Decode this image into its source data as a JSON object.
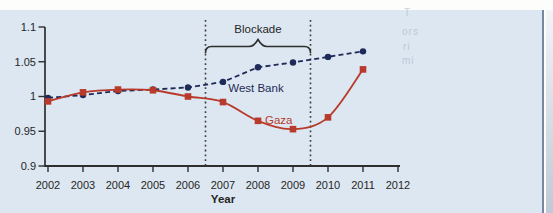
{
  "figure": {
    "panel_background": "#dde7f1",
    "edge_line_color": "#76879f",
    "axis_color": "#2e2e2e",
    "text_color": "#262626"
  },
  "chart_data": {
    "type": "line",
    "title": "",
    "xlabel": "Year",
    "ylabel": "",
    "xlim": [
      2002,
      2012
    ],
    "ylim": [
      0.9,
      1.1
    ],
    "grid": false,
    "legend": "inline-labels",
    "x_ticks": [
      "2002",
      "2003",
      "2004",
      "2005",
      "2006",
      "2007",
      "2008",
      "2009",
      "2010",
      "2011",
      "2012"
    ],
    "x_tick_values": [
      2002,
      2003,
      2004,
      2005,
      2006,
      2007,
      2008,
      2009,
      2010,
      2011,
      2012
    ],
    "y_ticks": [
      "0.9",
      "0.95",
      "1",
      "1.05",
      "1.1"
    ],
    "y_tick_values": [
      0.9,
      0.95,
      1,
      1.05,
      1.1
    ],
    "x": [
      2002,
      2003,
      2004,
      2005,
      2006,
      2007,
      2008,
      2009,
      2010,
      2011
    ],
    "series": [
      {
        "name": "West Bank",
        "color": "#1e2a58",
        "line_style": "dashed",
        "marker": "circle",
        "smooth": false,
        "values": [
          0.998,
          1.002,
          1.008,
          1.01,
          1.013,
          1.021,
          1.042,
          1.049,
          1.057,
          1.065
        ]
      },
      {
        "name": "Gaza",
        "color": "#b83a2b",
        "line_style": "solid",
        "marker": "square",
        "smooth": true,
        "values": [
          0.993,
          1.006,
          1.01,
          1.009,
          1.0,
          0.992,
          0.965,
          0.953,
          0.97,
          1.039
        ]
      }
    ],
    "series_labels": [
      {
        "text": "West Bank",
        "color": "#1e2a58",
        "x": 2007.15,
        "y": 1.006
      },
      {
        "text": "Gaza",
        "color": "#b83a2b",
        "x": 2008.2,
        "y": 0.96
      }
    ],
    "annotation": {
      "label": "Blockade",
      "x_start": 2006.5,
      "x_end": 2009.5,
      "boundary_line_style": "dotted"
    }
  },
  "artifacts": {
    "bleed_text": [
      "T",
      "ors",
      "ri",
      "mi"
    ]
  }
}
